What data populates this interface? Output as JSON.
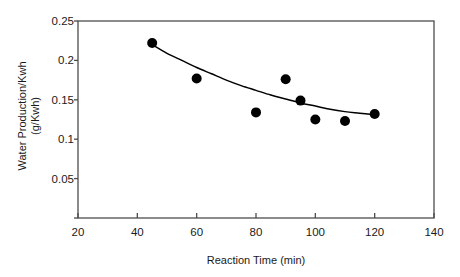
{
  "chart_data": {
    "type": "scatter",
    "title": "",
    "xlabel": "Reaction Time (min)",
    "ylabel_line1": "Water Production/Kwh",
    "ylabel_line2": "(g/Kwh)",
    "xlim": [
      20,
      140
    ],
    "ylim": [
      0,
      0.25
    ],
    "xticks": [
      20,
      40,
      60,
      80,
      100,
      120,
      140
    ],
    "xtick_labels": [
      "20",
      "40",
      "60",
      "80",
      "100",
      "120",
      "140"
    ],
    "yticks": [
      0,
      0.05,
      0.1,
      0.15,
      0.2,
      0.25
    ],
    "ytick_labels": [
      "",
      "0.05",
      "0.1",
      "0.15",
      "0.2",
      "0.25"
    ],
    "grid": false,
    "legend": false,
    "series": [
      {
        "name": "Water Production",
        "marker": "filled-circle",
        "color": "#000000",
        "x": [
          45,
          60,
          80,
          90,
          95,
          100,
          110,
          120
        ],
        "y": [
          0.222,
          0.177,
          0.134,
          0.176,
          0.149,
          0.125,
          0.123,
          0.132
        ]
      },
      {
        "name": "Fitted trend curve",
        "marker": "none",
        "line": "solid",
        "color": "#000000",
        "x": [
          45,
          50,
          55,
          60,
          65,
          70,
          75,
          80,
          85,
          90,
          95,
          100,
          105,
          110,
          115,
          120
        ],
        "y": [
          0.22,
          0.209,
          0.2,
          0.191,
          0.183,
          0.175,
          0.168,
          0.162,
          0.156,
          0.151,
          0.146,
          0.142,
          0.138,
          0.135,
          0.133,
          0.131
        ]
      }
    ]
  },
  "colors": {
    "axis": "#4d4d4d",
    "marker": "#000000",
    "curve": "#000000",
    "background": "#ffffff"
  }
}
